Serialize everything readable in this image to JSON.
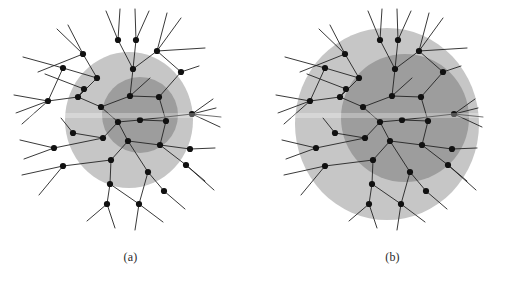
{
  "figure": {
    "width": 523,
    "height": 287,
    "background": "#ffffff"
  },
  "style": {
    "outer_disc_color": "#c6c6c6",
    "inner_disc_color": "#9d9d9d",
    "edge_color": "#222222",
    "node_color": "#111111",
    "node_radius": 3.1,
    "edge_width": 0.9,
    "caption_color": "#2a2a2a"
  },
  "graph": {
    "description": "wireless-network-tree",
    "nodes": [
      {
        "id": 0,
        "x": 118,
        "y": 122
      },
      {
        "id": 1,
        "x": 101,
        "y": 107
      },
      {
        "id": 2,
        "x": 140,
        "y": 120
      },
      {
        "id": 3,
        "x": 128,
        "y": 141
      },
      {
        "id": 4,
        "x": 103,
        "y": 138
      },
      {
        "id": 5,
        "x": 78,
        "y": 97
      },
      {
        "id": 6,
        "x": 130,
        "y": 96
      },
      {
        "id": 7,
        "x": 97,
        "y": 78
      },
      {
        "id": 8,
        "x": 133,
        "y": 69
      },
      {
        "id": 9,
        "x": 159,
        "y": 97
      },
      {
        "id": 10,
        "x": 73,
        "y": 133
      },
      {
        "id": 11,
        "x": 63,
        "y": 68
      },
      {
        "id": 12,
        "x": 48,
        "y": 101
      },
      {
        "id": 13,
        "x": 83,
        "y": 54
      },
      {
        "id": 14,
        "x": 118,
        "y": 40
      },
      {
        "id": 15,
        "x": 136,
        "y": 40
      },
      {
        "id": 16,
        "x": 157,
        "y": 51
      },
      {
        "id": 17,
        "x": 181,
        "y": 72
      },
      {
        "id": 18,
        "x": 166,
        "y": 121
      },
      {
        "id": 19,
        "x": 192,
        "y": 114
      },
      {
        "id": 20,
        "x": 160,
        "y": 145
      },
      {
        "id": 21,
        "x": 111,
        "y": 160
      },
      {
        "id": 22,
        "x": 54,
        "y": 148
      },
      {
        "id": 23,
        "x": 190,
        "y": 149
      },
      {
        "id": 24,
        "x": 186,
        "y": 165
      },
      {
        "id": 25,
        "x": 148,
        "y": 172
      },
      {
        "id": 26,
        "x": 63,
        "y": 166
      },
      {
        "id": 27,
        "x": 110,
        "y": 184
      },
      {
        "id": 28,
        "x": 107,
        "y": 204
      },
      {
        "id": 29,
        "x": 139,
        "y": 204
      },
      {
        "id": 30,
        "x": 164,
        "y": 191
      },
      {
        "id": 31,
        "x": 84,
        "y": 89
      }
    ],
    "edges": [
      [
        0,
        1
      ],
      [
        0,
        2
      ],
      [
        0,
        3
      ],
      [
        0,
        4
      ],
      [
        1,
        5
      ],
      [
        1,
        6
      ],
      [
        2,
        19
      ],
      [
        3,
        20
      ],
      [
        3,
        21
      ],
      [
        3,
        25
      ],
      [
        4,
        10
      ],
      [
        4,
        22
      ],
      [
        5,
        31
      ],
      [
        5,
        7
      ],
      [
        5,
        12
      ],
      [
        6,
        8
      ],
      [
        6,
        9
      ],
      [
        7,
        13
      ],
      [
        7,
        11
      ],
      [
        8,
        14
      ],
      [
        8,
        15
      ],
      [
        8,
        16
      ],
      [
        9,
        17
      ],
      [
        12,
        11
      ],
      [
        16,
        17
      ],
      [
        18,
        2
      ],
      [
        18,
        9
      ],
      [
        20,
        18
      ],
      [
        20,
        23
      ],
      [
        20,
        24
      ],
      [
        21,
        26
      ],
      [
        21,
        27
      ],
      [
        27,
        28
      ],
      [
        27,
        29
      ],
      [
        25,
        29
      ],
      [
        25,
        30
      ]
    ],
    "stubs": [
      {
        "from": 12,
        "x": 14,
        "y": 95
      },
      {
        "from": 12,
        "x": 16,
        "y": 113
      },
      {
        "from": 12,
        "x": 22,
        "y": 124
      },
      {
        "from": 11,
        "x": 23,
        "y": 57
      },
      {
        "from": 13,
        "x": 57,
        "y": 29
      },
      {
        "from": 13,
        "x": 68,
        "y": 25
      },
      {
        "from": 13,
        "x": 38,
        "y": 72
      },
      {
        "from": 14,
        "x": 106,
        "y": 11
      },
      {
        "from": 14,
        "x": 120,
        "y": 9
      },
      {
        "from": 15,
        "x": 135,
        "y": 9
      },
      {
        "from": 15,
        "x": 149,
        "y": 11
      },
      {
        "from": 16,
        "x": 167,
        "y": 13
      },
      {
        "from": 16,
        "x": 181,
        "y": 18
      },
      {
        "from": 16,
        "x": 205,
        "y": 48
      },
      {
        "from": 17,
        "x": 199,
        "y": 66
      },
      {
        "from": 19,
        "x": 213,
        "y": 99
      },
      {
        "from": 19,
        "x": 216,
        "y": 108
      },
      {
        "from": 19,
        "x": 221,
        "y": 117
      },
      {
        "from": 19,
        "x": 220,
        "y": 127
      },
      {
        "from": 22,
        "x": 20,
        "y": 140
      },
      {
        "from": 22,
        "x": 24,
        "y": 159
      },
      {
        "from": 26,
        "x": 22,
        "y": 175
      },
      {
        "from": 26,
        "x": 39,
        "y": 195
      },
      {
        "from": 23,
        "x": 215,
        "y": 148
      },
      {
        "from": 24,
        "x": 205,
        "y": 181
      },
      {
        "from": 24,
        "x": 214,
        "y": 190
      },
      {
        "from": 28,
        "x": 87,
        "y": 221
      },
      {
        "from": 28,
        "x": 115,
        "y": 228
      },
      {
        "from": 29,
        "x": 135,
        "y": 230
      },
      {
        "from": 29,
        "x": 163,
        "y": 222
      },
      {
        "from": 30,
        "x": 185,
        "y": 209
      },
      {
        "from": 10,
        "x": 61,
        "y": 118
      },
      {
        "from": 31,
        "x": 45,
        "y": 74
      },
      {
        "from": 6,
        "x": 150,
        "y": 78
      }
    ]
  },
  "panels": [
    {
      "id": "a",
      "caption": "(a)",
      "outer_disc": {
        "cx": 129,
        "cy": 120,
        "rx": 64,
        "ry": 68
      },
      "inner_disc": {
        "cx": 140,
        "cy": 115,
        "rx": 38,
        "ry": 38
      }
    },
    {
      "id": "b",
      "caption": "(b)",
      "outer_disc": {
        "cx": 125,
        "cy": 124,
        "rx": 92,
        "ry": 96
      },
      "inner_disc": {
        "cx": 143,
        "cy": 118,
        "rx": 64,
        "ry": 64
      }
    }
  ]
}
